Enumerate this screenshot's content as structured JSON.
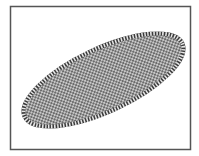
{
  "canvas": {
    "width": 199,
    "height": 156,
    "background": "#ffffff"
  },
  "frame": {
    "x": 10,
    "y": 6,
    "width": 181,
    "height": 144,
    "stroke": "#555555",
    "stroke_width": 1.5
  },
  "shape": {
    "type": "ellipse",
    "cx": 103.5,
    "cy": 80,
    "rx": 89,
    "ry": 33,
    "rotation": -25,
    "fill_pattern": "checkerboard",
    "fill_colors": [
      "#6b6b6b",
      "#c8c8c8"
    ],
    "border_style": "striped",
    "border_colors": [
      "#3a3a3a",
      "#e6e6e6"
    ]
  }
}
